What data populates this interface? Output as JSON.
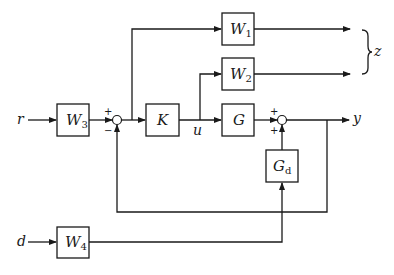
{
  "diagram": {
    "title": "",
    "blocks": {
      "W1": {
        "label": "W",
        "sub": "1"
      },
      "W2": {
        "label": "W",
        "sub": "2"
      },
      "W3": {
        "label": "W",
        "sub": "3"
      },
      "W4": {
        "label": "W",
        "sub": "4"
      },
      "K": {
        "label": "K",
        "sub": ""
      },
      "G": {
        "label": "G",
        "sub": ""
      },
      "Gd": {
        "label": "G",
        "sub": "d"
      }
    },
    "signals": {
      "r": "r",
      "d": "d",
      "u": "u",
      "y": "y",
      "z": "z"
    },
    "summing_junctions": {
      "sum1": {
        "top_sign": "+",
        "bottom_sign": "−"
      },
      "sum2": {
        "top_sign": "+",
        "bottom_sign": "+"
      }
    },
    "connections": [
      {
        "from": "r",
        "to": "W3"
      },
      {
        "from": "W3",
        "to": "sum1",
        "sign": "+"
      },
      {
        "from": "sum1",
        "to": "K"
      },
      {
        "from": "sum1",
        "to": "W1"
      },
      {
        "from": "K",
        "to": "G",
        "label": "u"
      },
      {
        "from": "u",
        "to": "W2"
      },
      {
        "from": "W1",
        "to": "z"
      },
      {
        "from": "W2",
        "to": "z"
      },
      {
        "from": "G",
        "to": "sum2",
        "sign": "+"
      },
      {
        "from": "Gd",
        "to": "sum2",
        "sign": "+"
      },
      {
        "from": "sum2",
        "to": "y"
      },
      {
        "from": "y",
        "to": "sum1",
        "sign": "−"
      },
      {
        "from": "d",
        "to": "W4"
      },
      {
        "from": "W4",
        "to": "Gd"
      }
    ]
  }
}
